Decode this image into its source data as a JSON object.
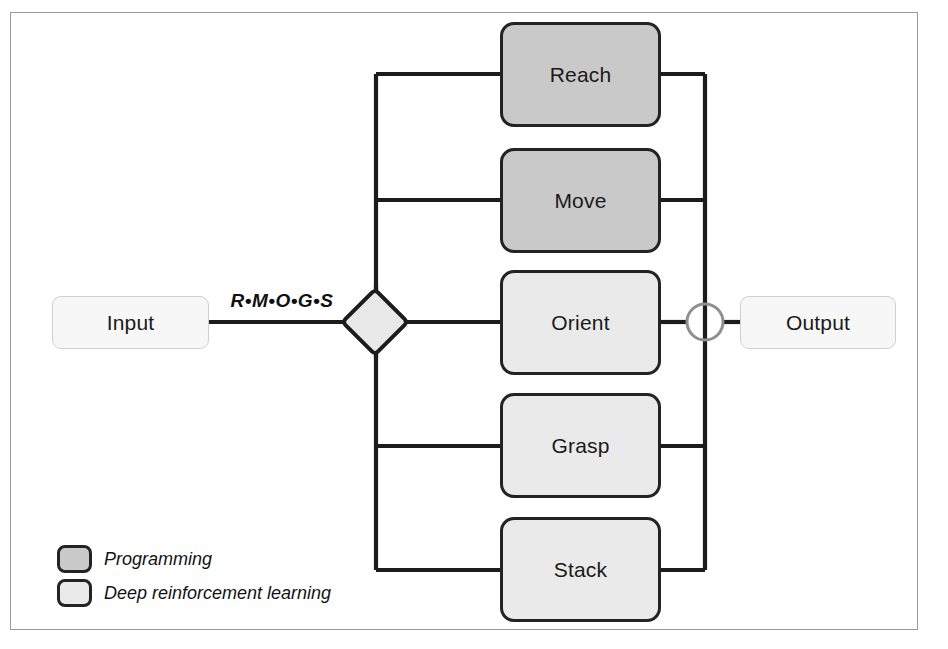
{
  "figure": {
    "background_color": "#ffffff",
    "frame_color": "#9a9a9a"
  },
  "input_node": {
    "label": "Input",
    "fill": "#f7f7f7",
    "border": "#cfcfcf"
  },
  "output_node": {
    "label": "Output",
    "fill": "#f7f7f7",
    "border": "#cfcfcf"
  },
  "edge": {
    "label": "R•M•O•G•S"
  },
  "splitter": {
    "shape": "diamond",
    "fill": "#e8e8e8",
    "border": "#1c1c1c"
  },
  "merger": {
    "shape": "circle",
    "fill": "#ffffff",
    "border": "#8f8f8f"
  },
  "tasks": [
    {
      "label": "Reach",
      "category": "programming",
      "fill": "#c9c9c9"
    },
    {
      "label": "Move",
      "category": "programming",
      "fill": "#c9c9c9"
    },
    {
      "label": "Orient",
      "category": "deep-reinforcement-learning",
      "fill": "#eaeaea"
    },
    {
      "label": "Grasp",
      "category": "deep-reinforcement-learning",
      "fill": "#eaeaea"
    },
    {
      "label": "Stack",
      "category": "deep-reinforcement-learning",
      "fill": "#eaeaea"
    }
  ],
  "legend": {
    "items": [
      {
        "label": "Programming",
        "fill": "#c9c9c9"
      },
      {
        "label": "Deep reinforcement learning",
        "fill": "#eaeaea"
      }
    ]
  },
  "colors": {
    "line": "#1c1c1c",
    "text": "#1a1a1a",
    "programming_fill": "#c9c9c9",
    "drl_fill": "#eaeaea"
  }
}
